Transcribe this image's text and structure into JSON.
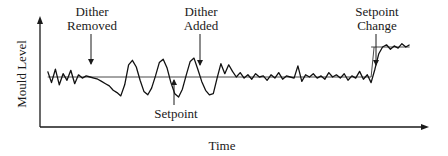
{
  "chart_data": {
    "type": "line",
    "title": "",
    "xlabel": "Time",
    "ylabel": "Mould Level",
    "grid": false,
    "legend": "none",
    "x_range": [
      0,
      100
    ],
    "y_range": [
      0,
      100
    ],
    "setpoint": {
      "name": "Setpoint",
      "segments": [
        {
          "x_start": 2,
          "x_end": 86,
          "value": 45
        },
        {
          "x_start": 86,
          "x_end": 96,
          "value": 72
        }
      ]
    },
    "series": [
      {
        "name": "Mould Level",
        "x": [
          2,
          3,
          4,
          5,
          6,
          7,
          8,
          9,
          10,
          11,
          12,
          13,
          14,
          15,
          16,
          17,
          18,
          19,
          20,
          21,
          22,
          23,
          24,
          25,
          26,
          27,
          28,
          29,
          30,
          31,
          32,
          33,
          34,
          35,
          36,
          37,
          38,
          39,
          40,
          41,
          42,
          43,
          44,
          45,
          46,
          47,
          48,
          49,
          50,
          51,
          52,
          53,
          54,
          55,
          56,
          57,
          58,
          59,
          60,
          61,
          62,
          63,
          64,
          65,
          66,
          67,
          68,
          69,
          70,
          71,
          72,
          73,
          74,
          75,
          76,
          77,
          78,
          79,
          80,
          81,
          82,
          83,
          84,
          85,
          86,
          87,
          88,
          89,
          90,
          91,
          92,
          93,
          94,
          95,
          96
        ],
        "values": [
          50,
          40,
          52,
          38,
          48,
          42,
          51,
          39,
          47,
          44,
          46,
          45,
          44,
          43,
          41,
          39,
          37,
          33,
          31,
          28,
          38,
          56,
          60,
          54,
          42,
          32,
          29,
          35,
          46,
          58,
          61,
          53,
          40,
          30,
          27,
          34,
          47,
          59,
          62,
          52,
          41,
          33,
          29,
          30,
          44,
          57,
          48,
          56,
          50,
          45,
          49,
          44,
          47,
          43,
          48,
          45,
          46,
          42,
          47,
          44,
          49,
          43,
          46,
          45,
          44,
          55,
          41,
          47,
          45,
          48,
          44,
          46,
          43,
          49,
          45,
          47,
          44,
          48,
          42,
          46,
          44,
          50,
          43,
          47,
          40,
          52,
          66,
          72,
          74,
          70,
          73,
          71,
          75,
          72,
          74
        ]
      }
    ],
    "annotations": [
      {
        "text_lines": [
          "Dither",
          "Removed"
        ],
        "points_to": "x=13, above trace",
        "arrow": "down"
      },
      {
        "text_lines": [
          "Dither",
          "Added"
        ],
        "points_to": "x=40, above trace",
        "arrow": "down"
      },
      {
        "text_lines": [
          "Setpoint"
        ],
        "points_to": "setpoint line at x=34",
        "arrow": "up"
      },
      {
        "text_lines": [
          "Setpoint",
          "Change"
        ],
        "points_to": "x=86, step in setpoint",
        "arrow": "down"
      }
    ]
  }
}
